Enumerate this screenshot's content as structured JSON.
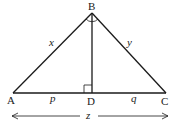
{
  "diagram": {
    "title": "",
    "vertices": {
      "A": {
        "label": "A"
      },
      "B": {
        "label": "B"
      },
      "C": {
        "label": "C"
      },
      "D": {
        "label": "D"
      }
    },
    "segment_labels": {
      "AB": "x",
      "BC": "y",
      "AD": "p",
      "DC": "q",
      "AC_total": "z"
    },
    "markings": [
      "right angle at D",
      "right angle at B"
    ]
  }
}
